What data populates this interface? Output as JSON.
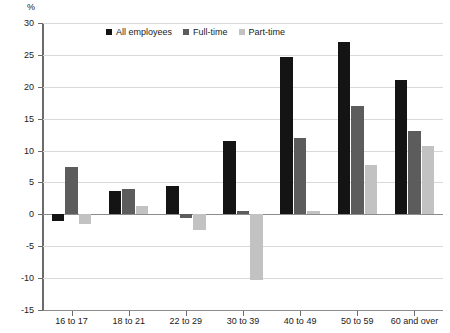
{
  "chart_data": {
    "type": "bar",
    "title": "",
    "xlabel": "",
    "ylabel": "%",
    "unit_label": "%",
    "categories": [
      "16 to 17",
      "18 to 21",
      "22 to 29",
      "30 to 39",
      "40 to 49",
      "50 to 59",
      "60 and over"
    ],
    "series": [
      {
        "name": "All employees",
        "color": "#141414",
        "values": [
          -1.0,
          3.7,
          4.4,
          11.5,
          24.7,
          27.0,
          21.0
        ]
      },
      {
        "name": "Full-time",
        "color": "#5c5c5c",
        "values": [
          7.5,
          4.0,
          -0.5,
          0.5,
          12.0,
          17.0,
          13.0
        ]
      },
      {
        "name": "Part-time",
        "color": "#c2c2c2",
        "values": [
          -1.5,
          1.3,
          -2.5,
          -10.3,
          0.6,
          7.8,
          10.7
        ]
      }
    ],
    "ylim": [
      -15,
      30
    ],
    "ytick_values": [
      30,
      25,
      20,
      15,
      10,
      5,
      0,
      -5,
      -10,
      -15
    ],
    "ytick_labels": [
      "30",
      "25",
      "20",
      "15",
      "10",
      "5",
      "0",
      "-5",
      "-10",
      "-15"
    ],
    "grid": true,
    "legend_position": "top-center"
  }
}
